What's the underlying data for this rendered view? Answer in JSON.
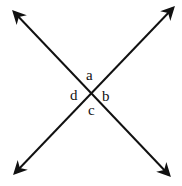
{
  "diagram": {
    "type": "intersecting-lines",
    "stroke_color": "#111111",
    "background_color": "#ffffff",
    "lines": [
      {
        "name": "line-1",
        "from": [
          12,
          10
        ],
        "to": [
          171,
          177
        ],
        "arrowheads": "both"
      },
      {
        "name": "line-2",
        "from": [
          175,
          6
        ],
        "to": [
          13,
          175
        ],
        "arrowheads": "both"
      }
    ],
    "intersection": [
      91,
      94
    ],
    "angles": [
      {
        "label": "a",
        "position": "top"
      },
      {
        "label": "b",
        "position": "right"
      },
      {
        "label": "c",
        "position": "bottom"
      },
      {
        "label": "d",
        "position": "left"
      }
    ]
  }
}
